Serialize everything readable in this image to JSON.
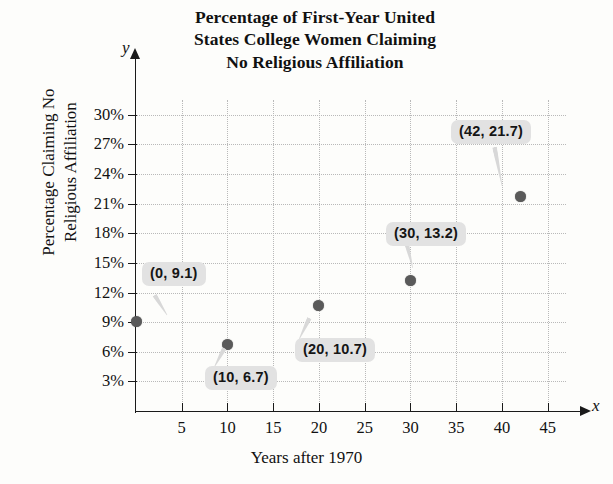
{
  "chart_data": {
    "type": "scatter",
    "title": "Percentage of First-Year United States College Women Claiming No Religious Affiliation",
    "title_lines": [
      "Percentage of First-Year United",
      "States College Women Claiming",
      "No Religious Affiliation"
    ],
    "xlabel": "Years after 1970",
    "ylabel": "Percentage Claiming No Religious Affiliation",
    "ylabel_lines": [
      "Percentage Claiming No",
      "Religious Affiliation"
    ],
    "x_axis_letter": "x",
    "y_axis_letter": "y",
    "x": [
      0,
      10,
      20,
      30,
      42
    ],
    "y": [
      9.1,
      6.7,
      10.7,
      13.2,
      21.7
    ],
    "point_labels": [
      "(0, 9.1)",
      "(10, 6.7)",
      "(20, 10.7)",
      "(30, 13.2)",
      "(42, 21.7)"
    ],
    "xlim": [
      0,
      47
    ],
    "ylim": [
      0,
      31.5
    ],
    "xticks": [
      5,
      10,
      15,
      20,
      25,
      30,
      35,
      40,
      45
    ],
    "xtick_labels": [
      "5",
      "10",
      "15",
      "20",
      "25",
      "30",
      "35",
      "40",
      "45"
    ],
    "yticks": [
      3,
      6,
      9,
      12,
      15,
      18,
      21,
      24,
      27,
      30
    ],
    "ytick_labels": [
      "3%",
      "6%",
      "9%",
      "12%",
      "15%",
      "18%",
      "21%",
      "24%",
      "27%",
      "30%"
    ],
    "grid": true,
    "legend": null,
    "marker_color": "#5a5a5a",
    "callout_bg": "#e2e2e2",
    "grid_color": "#b9b9b9",
    "axis_color": "#1a1a1a",
    "background": "#fdfdfb"
  }
}
